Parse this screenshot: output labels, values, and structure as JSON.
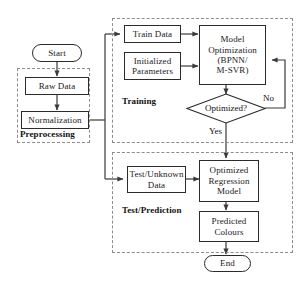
{
  "diagram": {
    "type": "flowchart",
    "orientation": "top-to-bottom",
    "colors": {
      "node_border": "#2b2b2b",
      "node_fill": "#ffffff",
      "group_border": "#8c8c8c",
      "connector": "#3a3a3a",
      "text": "#111111",
      "background": "#ffffff"
    }
  },
  "nodes": {
    "start": {
      "label": "Start",
      "shape": "terminal"
    },
    "raw_data": {
      "label": "Raw Data",
      "shape": "process"
    },
    "normalization": {
      "label": "Normalization",
      "shape": "process"
    },
    "train_data": {
      "label": "Train Data",
      "shape": "process"
    },
    "initialized_parameters": {
      "label": "Initialized\nParameters",
      "shape": "process"
    },
    "model_optimization": {
      "label": "Model\nOptimization\n(BPNN/\nM-SVR)",
      "shape": "process"
    },
    "optimized_decision": {
      "label": "Optimized?",
      "shape": "decision"
    },
    "test_unknown_data": {
      "label": "Test/Unknown\nData",
      "shape": "process"
    },
    "optimized_regression_model": {
      "label": "Optimized\nRegression\nModel",
      "shape": "process"
    },
    "predicted_colours": {
      "label": "Predicted\nColours",
      "shape": "process"
    },
    "end": {
      "label": "End",
      "shape": "terminal"
    }
  },
  "groups": {
    "preprocessing": {
      "label": "Preprocessing"
    },
    "training": {
      "label": "Training"
    },
    "test_prediction": {
      "label": "Test/Prediction"
    }
  },
  "edge_labels": {
    "yes": "Yes",
    "no": "No"
  },
  "edges": [
    {
      "from": "start",
      "to": "raw_data",
      "label": ""
    },
    {
      "from": "raw_data",
      "to": "normalization",
      "label": ""
    },
    {
      "from": "normalization",
      "to": "train_data",
      "label": ""
    },
    {
      "from": "normalization",
      "to": "test_unknown_data",
      "label": ""
    },
    {
      "from": "train_data",
      "to": "model_optimization",
      "label": ""
    },
    {
      "from": "initialized_parameters",
      "to": "model_optimization",
      "label": ""
    },
    {
      "from": "model_optimization",
      "to": "optimized_decision",
      "label": ""
    },
    {
      "from": "optimized_decision",
      "to": "model_optimization",
      "label": "No"
    },
    {
      "from": "optimized_decision",
      "to": "optimized_regression_model",
      "label": "Yes"
    },
    {
      "from": "test_unknown_data",
      "to": "optimized_regression_model",
      "label": ""
    },
    {
      "from": "optimized_regression_model",
      "to": "predicted_colours",
      "label": ""
    },
    {
      "from": "predicted_colours",
      "to": "end",
      "label": ""
    }
  ]
}
